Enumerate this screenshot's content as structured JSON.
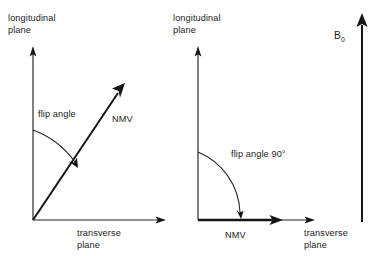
{
  "figure": {
    "background_color": "#ffffff",
    "ink_color": "#1b1b1b"
  },
  "left_diagram": {
    "name": "partial-flip-angle-diagram",
    "longitudinal_label_line1": "longitudinal",
    "longitudinal_label_line2": "plane",
    "transverse_label_line1": "transverse",
    "transverse_label_line2": "plane",
    "flip_angle_label": "flip angle",
    "nmv_label": "NMV",
    "flip_angle_degrees": 56,
    "nmv_direction": "oblique, between longitudinal and transverse planes"
  },
  "right_diagram": {
    "name": "ninety-degree-flip-angle-diagram",
    "longitudinal_label_line1": "longitudinal",
    "longitudinal_label_line2": "plane",
    "transverse_label_line1": "transverse",
    "transverse_label_line2": "plane",
    "flip_angle_label": "flip angle 90°",
    "nmv_label": "NMV",
    "flip_angle_degrees": 90,
    "nmv_direction": "fully within the transverse plane"
  },
  "field_vector": {
    "name": "static-magnetic-field-vector",
    "symbol": "B",
    "subscript": "0",
    "label": "B0",
    "direction": "vertical, upward"
  }
}
